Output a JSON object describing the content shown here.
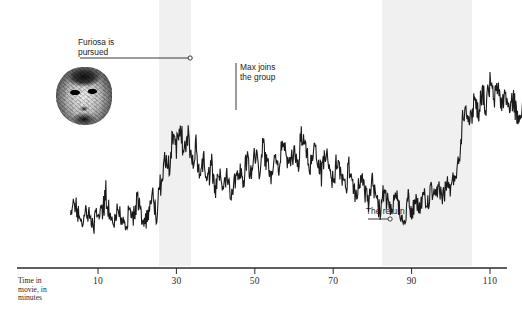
{
  "chart_data": {
    "type": "line",
    "title": "",
    "xlabel": "Time in\nmovie, in\nminutes",
    "ylabel": "",
    "xlim": [
      0,
      120
    ],
    "ylim": [
      0,
      100
    ],
    "grid": false,
    "legend_position": "none",
    "x_ticks": [
      10,
      30,
      50,
      70,
      90,
      110
    ],
    "x_tick_labels": [
      "10",
      "30",
      "50",
      "70",
      "90",
      "110"
    ],
    "series": [
      {
        "name": "Action intensity",
        "x": [
          3,
          4,
          5,
          6,
          7,
          8,
          9,
          10,
          11,
          12,
          13,
          14,
          15,
          16,
          17,
          18,
          19,
          20,
          21,
          22,
          23,
          24,
          25,
          26,
          27,
          28,
          29,
          30,
          31,
          32,
          33,
          34,
          35,
          36,
          37,
          38,
          39,
          40,
          41,
          42,
          43,
          44,
          45,
          46,
          47,
          48,
          49,
          50,
          51,
          52,
          53,
          54,
          55,
          56,
          57,
          58,
          59,
          60,
          61,
          62,
          63,
          64,
          65,
          66,
          67,
          68,
          69,
          70,
          71,
          72,
          73,
          74,
          75,
          76,
          77,
          78,
          79,
          80,
          81,
          82,
          83,
          84,
          85,
          86,
          87,
          88,
          89,
          90,
          91,
          92,
          93,
          94,
          95,
          96,
          97,
          98,
          99,
          100,
          101,
          102,
          103,
          104,
          105,
          106,
          107,
          108,
          109,
          110,
          111,
          112,
          113,
          114,
          115,
          116,
          117,
          118,
          119,
          120
        ],
        "values": [
          18,
          30,
          24,
          20,
          26,
          22,
          19,
          27,
          23,
          34,
          21,
          18,
          28,
          22,
          17,
          25,
          20,
          31,
          24,
          19,
          27,
          33,
          22,
          40,
          54,
          47,
          62,
          58,
          68,
          55,
          64,
          50,
          58,
          44,
          52,
          40,
          48,
          36,
          44,
          38,
          46,
          34,
          42,
          48,
          40,
          52,
          44,
          56,
          46,
          60,
          50,
          44,
          56,
          48,
          62,
          54,
          46,
          58,
          50,
          64,
          56,
          48,
          60,
          52,
          44,
          56,
          48,
          40,
          52,
          44,
          36,
          48,
          40,
          32,
          44,
          36,
          28,
          40,
          32,
          24,
          36,
          28,
          22,
          34,
          26,
          20,
          32,
          24,
          30,
          26,
          34,
          28,
          36,
          30,
          38,
          32,
          40,
          36,
          44,
          50,
          74,
          80,
          70,
          84,
          76,
          88,
          78,
          92,
          82,
          90,
          80,
          86,
          76,
          84,
          72,
          80,
          68,
          6
        ]
      }
    ],
    "shaded_bands": [
      {
        "name": "band-1",
        "x_start": 25.5,
        "x_end": 33.7
      },
      {
        "name": "band-2",
        "x_start": 82.5,
        "x_end": 105.5
      }
    ],
    "annotations": [
      {
        "id": "furiosa",
        "text": "Furiosa is\npursued",
        "pointer_x": 33.0
      },
      {
        "id": "max",
        "text": "Max joins\nthe group",
        "pointer_x": 54.0
      },
      {
        "id": "return",
        "text": "The return",
        "pointer_x": 84.0
      }
    ],
    "images": [
      {
        "id": "furiosa-portrait",
        "alt": "Furiosa face cut-out photo"
      }
    ]
  },
  "axis": {
    "caption_line1": "Time in",
    "caption_line2": "movie, in",
    "caption_line3": "minutes"
  },
  "ticks": [
    {
      "label": "10"
    },
    {
      "label": "30"
    },
    {
      "label": "50"
    },
    {
      "label": "70"
    },
    {
      "label": "90"
    },
    {
      "label": "110"
    }
  ],
  "annotations": {
    "furiosa": "Furiosa is\npursued",
    "max": "Max joins\nthe group",
    "the_return": "The return"
  },
  "colors": {
    "background": "#ffffff",
    "band": "#f0f0f0",
    "line": "#1a1a1a",
    "axis": "#2a2a2a",
    "text": "#1d1d1d"
  }
}
